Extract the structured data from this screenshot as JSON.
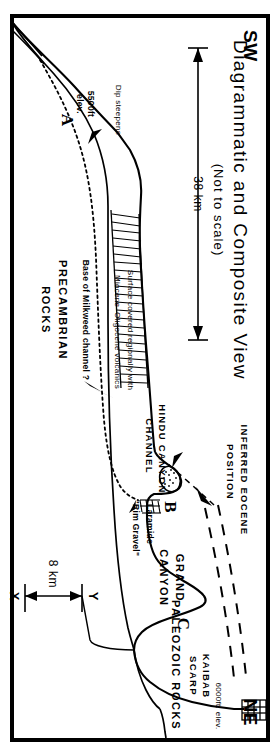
{
  "figure": {
    "title": "Diagrammatic and Composite View",
    "subtitle": "(Not to scale)",
    "orientation_left": "SW",
    "orientation_right": "NE"
  },
  "scales": {
    "horizontal": "38 km",
    "vertical": "8 km",
    "vertical_bottom_tick": "X",
    "vertical_top_tick": "Y"
  },
  "points": {
    "a": "A",
    "b": "B",
    "c": "C"
  },
  "units": {
    "precambrian": "PRECAMBRIAN",
    "precambrian_2": "ROCKS",
    "paleozoic": "PALEOZOIC ROCKS"
  },
  "annotations": {
    "kaibab_scarp_1": "KAIBAB",
    "kaibab_scarp_2": "SCARP",
    "kaibab_elev": "6000ft. elev.",
    "inferred_eocene_1": "INFERRED EOCENE",
    "inferred_eocene_2": "POSITION",
    "grand_canyon_1": "GRAND",
    "grand_canyon_2": "CANYON",
    "hindu_canyon_1": "HINDU CANYON",
    "hindu_canyon_2": "CHANNEL",
    "laramide_1": "Laramide",
    "laramide_2": "\"Rim Gravel\"",
    "surface_cover_1": "Surface covered regionally with",
    "surface_cover_2": "Miocene–Oligocene volcanics",
    "milkweed": "Base of Milkweed channel  ?",
    "dip_steepens": "Dip steepens",
    "elev_a_1": "5500ft",
    "elev_a_2": "elev."
  },
  "colors": {
    "ink": "#000000",
    "paper": "#ffffff"
  }
}
